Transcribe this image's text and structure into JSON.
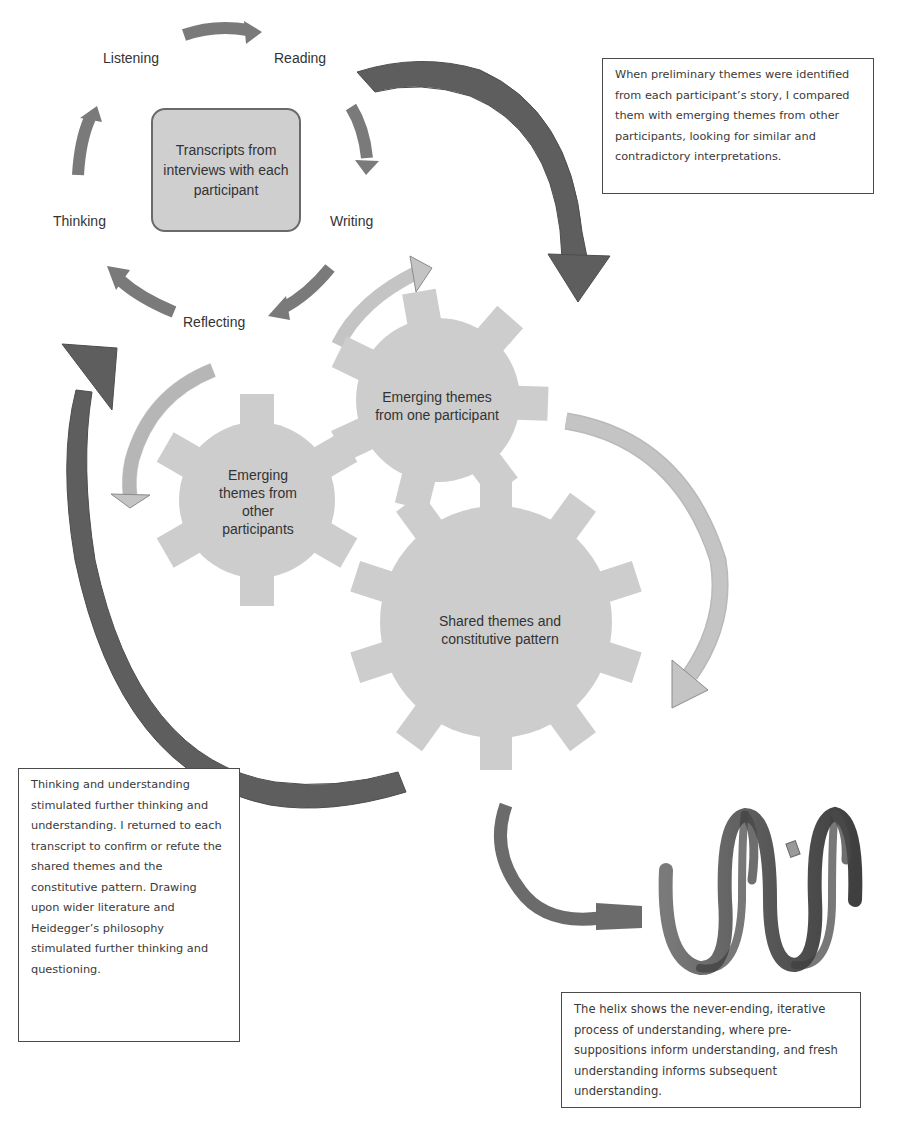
{
  "cycle": {
    "center": "Transcripts from interviews with each participant",
    "labels": {
      "listening": "Listening",
      "reading": "Reading",
      "writing": "Writing",
      "reflecting": "Reflecting",
      "thinking": "Thinking"
    }
  },
  "gears": {
    "one_participant": "Emerging themes from one participant",
    "other_participants": "Emerging themes from other participants",
    "shared": "Shared themes and constitutive pattern"
  },
  "notes": {
    "top_right": "When preliminary themes were identified from each participant’s story, I compared them with emerging themes  from other participants, looking for similar and contradictory interpretations.",
    "bottom_left": "Thinking and understanding stimulated further thinking and understanding. I returned to each transcript to confirm or refute  the shared themes  and the constitutive pattern. Drawing upon wider literature and Heidegger’s philosophy stimulated further thinking and questioning.",
    "bottom_right": "The helix shows the never-ending, iterative process of understanding, where pre-suppositions inform understanding, and fresh understanding informs subsequent understanding."
  },
  "colors": {
    "cycle_arrow": "#7a7a7a",
    "big_arrow": "#5e5e5e",
    "light_arrow": "#c4c4c4",
    "gear_fill": "#cdcdcd",
    "center_box_fill": "#cfcfcf",
    "helix": "#6b6b6b"
  }
}
